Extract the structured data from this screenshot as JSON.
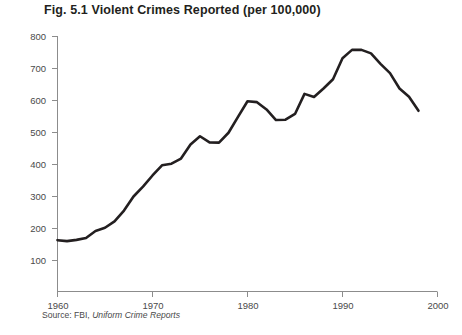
{
  "figure": {
    "title": "Fig. 5.1  Violent Crimes Reported (per 100,000)",
    "source_prefix": "Source: FBI, ",
    "source_italic": "Uniform Crime Reports"
  },
  "colors": {
    "line": "#231f20",
    "axis": "#8c8c8c",
    "text": "#4a4a4a",
    "title": "#231f20",
    "background": "#ffffff"
  },
  "chart_data": {
    "type": "line",
    "title": "Fig. 5.1  Violent Crimes Reported (per 100,000)",
    "xlabel": "",
    "ylabel": "",
    "xlim": [
      1960,
      2000
    ],
    "ylim": [
      0,
      800
    ],
    "grid": false,
    "legend": "none",
    "xticks": [
      1960,
      1970,
      1980,
      1990,
      2000
    ],
    "xtick_labels": [
      "1960",
      "1970",
      "1980",
      "1990",
      "2000"
    ],
    "yticks": [
      100,
      200,
      300,
      400,
      500,
      600,
      700,
      800
    ],
    "ytick_labels": [
      "100",
      "200",
      "300",
      "400",
      "500",
      "600",
      "700",
      "800"
    ],
    "series": [
      {
        "name": "Violent crimes reported per 100,000",
        "x": [
          1960,
          1961,
          1962,
          1963,
          1964,
          1965,
          1966,
          1967,
          1968,
          1969,
          1970,
          1971,
          1972,
          1973,
          1974,
          1975,
          1976,
          1977,
          1978,
          1979,
          1980,
          1981,
          1982,
          1983,
          1984,
          1985,
          1986,
          1987,
          1988,
          1989,
          1990,
          1991,
          1992,
          1993,
          1994,
          1995,
          1996,
          1997,
          1998
        ],
        "values": [
          161,
          158,
          162,
          168,
          190,
          200,
          220,
          254,
          298,
          329,
          364,
          396,
          401,
          417,
          461,
          487,
          468,
          467,
          498,
          548,
          597,
          594,
          571,
          538,
          539,
          557,
          620,
          610,
          637,
          666,
          732,
          758,
          758,
          747,
          714,
          685,
          637,
          611,
          567
        ]
      }
    ]
  }
}
